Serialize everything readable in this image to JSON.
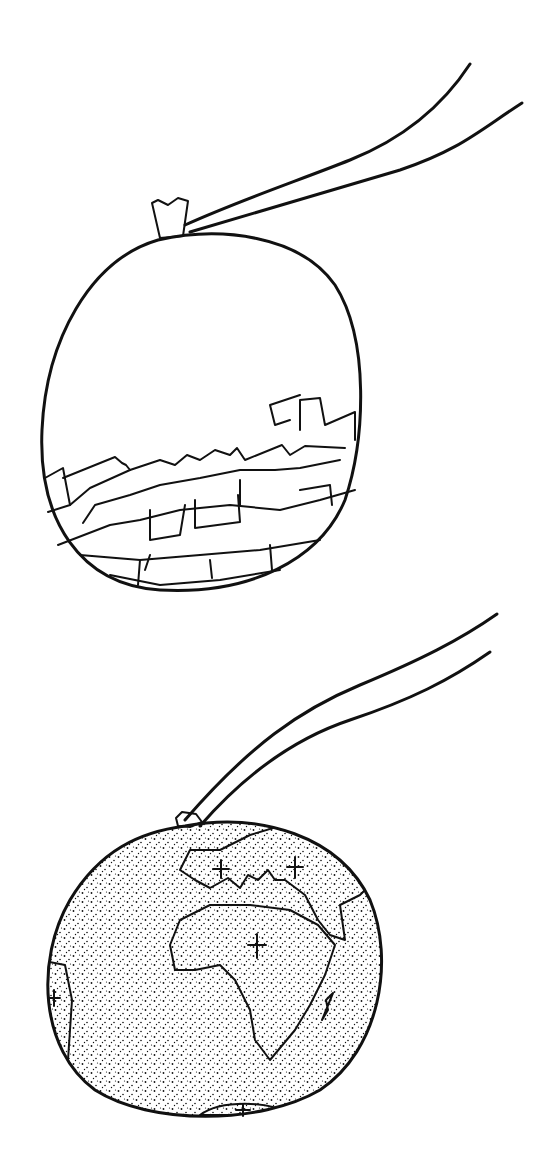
{
  "illustration": {
    "background": "#ffffff",
    "ink_color": "#111111",
    "panels": [
      {
        "name": "balloon-with-rubble",
        "subject": "tied balloon with string, containing broken bricks/rubble in lower half"
      },
      {
        "name": "balloon-globe",
        "subject": "tied balloon drawn as Earth globe showing Europe and Africa with cross marks"
      }
    ]
  }
}
